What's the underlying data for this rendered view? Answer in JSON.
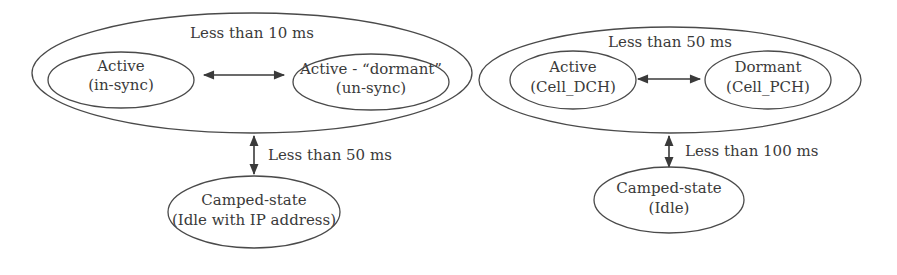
{
  "diagrams": [
    {
      "name": "left-diagram",
      "group_label": "Less than 10 ms",
      "states": {
        "active": {
          "line1": "Active",
          "line2": "(in-sync)"
        },
        "dormant": {
          "line1": "Active - “dormant”",
          "line2": "(un-sync)"
        },
        "camped": {
          "line1": "Camped-state",
          "line2": "(Idle with IP address)"
        }
      },
      "transition_label": "Less than 50 ms"
    },
    {
      "name": "right-diagram",
      "group_label": "Less than 50 ms",
      "states": {
        "active": {
          "line1": "Active",
          "line2": "(Cell_DCH)"
        },
        "dormant": {
          "line1": "Dormant",
          "line2": "(Cell_PCH)"
        },
        "camped": {
          "line1": "Camped-state",
          "line2": "(Idle)"
        }
      },
      "transition_label": "Less than 100 ms"
    }
  ],
  "colors": {
    "stroke": "#4a4a4a",
    "text": "#3a3a3a",
    "background": "#ffffff"
  }
}
